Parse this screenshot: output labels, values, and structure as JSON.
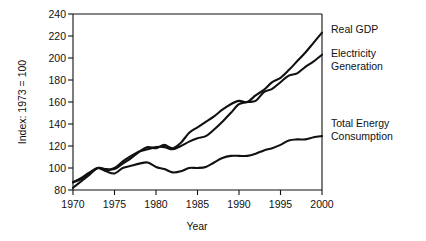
{
  "chart_data": {
    "type": "line",
    "title": "",
    "xlabel": "Year",
    "ylabel": "Index: 1973 = 100",
    "xlim": [
      1970,
      2000
    ],
    "ylim": [
      80,
      240
    ],
    "xticks": [
      1970,
      1975,
      1980,
      1985,
      1990,
      1995,
      2000
    ],
    "yticks": [
      80,
      100,
      120,
      140,
      160,
      180,
      200,
      220,
      240
    ],
    "grid": false,
    "legend_position": "right-inline",
    "x": [
      1970,
      1971,
      1972,
      1973,
      1974,
      1975,
      1976,
      1977,
      1978,
      1979,
      1980,
      1981,
      1982,
      1983,
      1984,
      1985,
      1986,
      1987,
      1988,
      1989,
      1990,
      1991,
      1992,
      1993,
      1994,
      1995,
      1996,
      1997,
      1998,
      1999,
      2000
    ],
    "series": [
      {
        "name": "Real GDP",
        "label": "Real GDP",
        "color": "#111111",
        "values": [
          87,
          90,
          95,
          100,
          99,
          99,
          104,
          109,
          115,
          119,
          118,
          121,
          118,
          123,
          132,
          137,
          142,
          147,
          153,
          158,
          161,
          160,
          166,
          171,
          178,
          182,
          189,
          197,
          205,
          214,
          223
        ]
      },
      {
        "name": "Electricity Generation",
        "label": "Electricity Generation",
        "color": "#111111",
        "values": [
          82,
          88,
          94,
          100,
          98,
          100,
          106,
          111,
          115,
          117,
          119,
          119,
          117,
          120,
          124,
          127,
          129,
          135,
          142,
          150,
          158,
          160,
          161,
          169,
          172,
          178,
          184,
          186,
          192,
          197,
          203
        ]
      },
      {
        "name": "Total Energy Consumption",
        "label": "Total Energy Consumption",
        "color": "#111111",
        "values": [
          87,
          91,
          96,
          100,
          97,
          95,
          100,
          102,
          104,
          105,
          101,
          99,
          96,
          97,
          100,
          100,
          101,
          105,
          109,
          111,
          111,
          111,
          113,
          116,
          118,
          121,
          125,
          126,
          126,
          128,
          129
        ]
      }
    ],
    "annotations": [
      {
        "text": "Real GDP",
        "series": "Real GDP"
      },
      {
        "text": "Electricity Generation",
        "series": "Electricity Generation"
      },
      {
        "text": "Total Energy Consumption",
        "series": "Total Energy Consumption"
      }
    ]
  },
  "labels": {
    "y_axis": "Index: 1973 = 100",
    "x_axis": "Year",
    "series_1_line1": "Real GDP",
    "series_2_line1": "Electricity",
    "series_2_line2": "Generation",
    "series_3_line1": "Total Energy",
    "series_3_line2": "Consumption"
  },
  "ticks": {
    "y": [
      "240",
      "220",
      "200",
      "180",
      "160",
      "140",
      "120",
      "100",
      "80"
    ],
    "x": [
      "1970",
      "1975",
      "1980",
      "1985",
      "1990",
      "1995",
      "2000"
    ]
  },
  "colors": {
    "line": "#111111",
    "axis": "#111111",
    "background": "#ffffff"
  }
}
